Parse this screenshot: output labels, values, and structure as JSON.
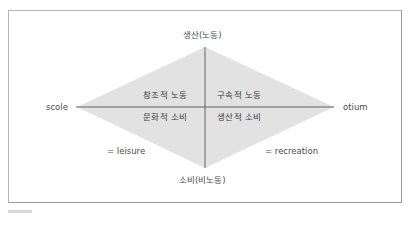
{
  "diagram": {
    "axes": {
      "top": "생산(노동)",
      "bottom": "소비(비노동)",
      "left": "scole",
      "right": "otium"
    },
    "quadrants": {
      "top_left": "창조적 노동",
      "top_right": "구속적 노동",
      "bottom_left": "문화적 소비",
      "bottom_right": "생산적 소비"
    },
    "annotations": {
      "left": "= leisure",
      "right": "= recreation"
    },
    "colors": {
      "diamond_fill": "#e2e2e2",
      "axis_line": "#555555",
      "frame_border": "#b5b5b5"
    }
  }
}
